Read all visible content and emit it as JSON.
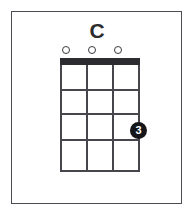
{
  "diagram": {
    "title": "C",
    "instrument_strings": 4,
    "fret_count": 4,
    "colors": {
      "ink": "#2d2d31",
      "grid": "#46464c",
      "frame": "#4b4b52",
      "dot_fill": "#16161a",
      "dot_text": "#ffffff",
      "background": "#ffffff"
    },
    "open_markers": [
      {
        "symbol": "o",
        "name": "open-string-marker-1",
        "string": 1,
        "left": 62,
        "top": 46
      },
      {
        "symbol": "o",
        "name": "open-string-marker-2",
        "string": 2,
        "left": 88,
        "top": 46
      },
      {
        "symbol": "o",
        "name": "open-string-marker-3",
        "string": 3,
        "left": 114,
        "top": 46
      }
    ],
    "strings": [
      {
        "label": "string-1",
        "left": 0
      },
      {
        "label": "string-2",
        "left": 26
      },
      {
        "label": "string-3",
        "left": 52
      },
      {
        "label": "string-4",
        "left": 78
      }
    ],
    "frets": [
      {
        "label": "fret-line-1",
        "top": 24
      },
      {
        "label": "fret-line-2",
        "top": 48
      },
      {
        "label": "fret-line-3",
        "top": 74
      },
      {
        "label": "fret-line-4",
        "top": 105
      }
    ],
    "finger_dots": [
      {
        "finger": "3",
        "name": "finger-dot-3",
        "string": 4,
        "fret": 3,
        "left": 130,
        "top": 122
      }
    ]
  }
}
